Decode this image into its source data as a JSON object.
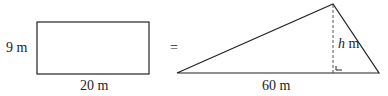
{
  "rectangle": {
    "height_label": "9 m",
    "width_label": "20 m"
  },
  "equals": "=",
  "triangle": {
    "base_label": "60 m",
    "height_var": "h",
    "height_unit": " m"
  },
  "colors": {
    "stroke": "#222222",
    "background": "#ffffff"
  }
}
